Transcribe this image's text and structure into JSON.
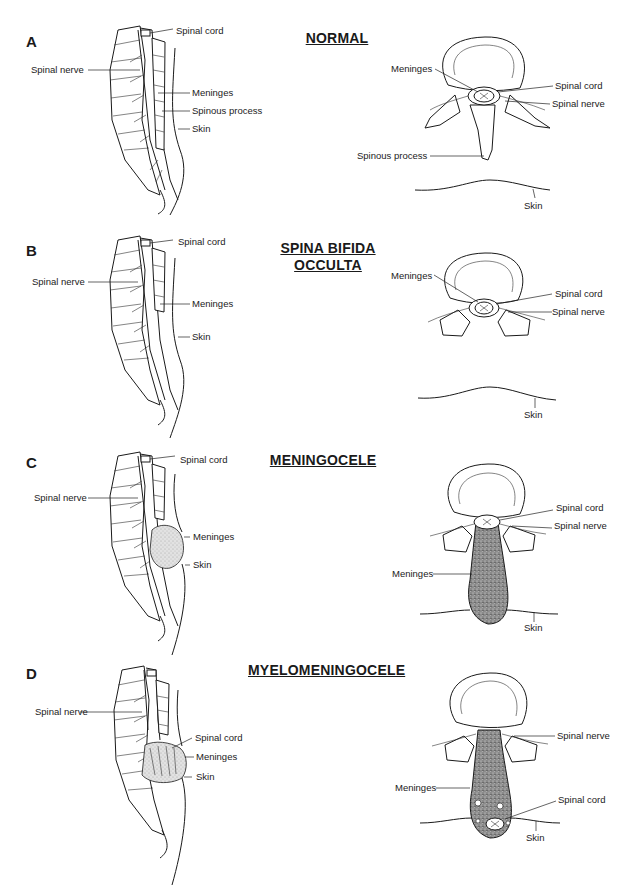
{
  "figure": {
    "panels": [
      {
        "letter": "A",
        "title": "NORMAL",
        "sagittal_labels": {
          "spinal_cord": "Spinal cord",
          "spinal_nerve": "Spinal nerve",
          "meninges": "Meninges",
          "spinous_process": "Spinous process",
          "skin": "Skin"
        },
        "axial_labels": {
          "meninges": "Meninges",
          "spinal_cord": "Spinal cord",
          "spinal_nerve": "Spinal nerve",
          "spinous_process": "Spinous process",
          "skin": "Skin"
        }
      },
      {
        "letter": "B",
        "title_line1": "SPINA BIFIDA",
        "title_line2": "OCCULTA",
        "sagittal_labels": {
          "spinal_cord": "Spinal cord",
          "spinal_nerve": "Spinal nerve",
          "meninges": "Meninges",
          "skin": "Skin"
        },
        "axial_labels": {
          "meninges": "Meninges",
          "spinal_cord": "Spinal cord",
          "spinal_nerve": "Spinal nerve",
          "skin": "Skin"
        }
      },
      {
        "letter": "C",
        "title": "MENINGOCELE",
        "sagittal_labels": {
          "spinal_cord": "Spinal cord",
          "spinal_nerve": "Spinal nerve",
          "meninges": "Meninges",
          "skin": "Skin"
        },
        "axial_labels": {
          "spinal_cord": "Spinal cord",
          "spinal_nerve": "Spinal nerve",
          "meninges": "Meninges",
          "skin": "Skin"
        }
      },
      {
        "letter": "D",
        "title": "MYELOMENINGOCELE",
        "sagittal_labels": {
          "spinal_nerve": "Spinal nerve",
          "spinal_cord": "Spinal cord",
          "meninges": "Meninges",
          "skin": "Skin"
        },
        "axial_labels": {
          "spinal_nerve": "Spinal nerve",
          "meninges": "Meninges",
          "spinal_cord": "Spinal cord",
          "skin": "Skin"
        }
      }
    ]
  }
}
